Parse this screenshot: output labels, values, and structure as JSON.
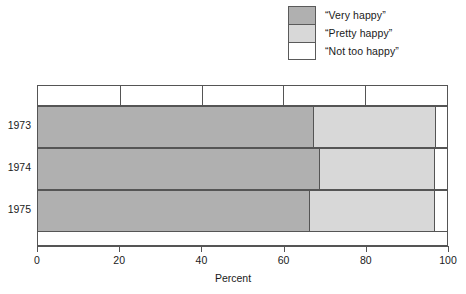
{
  "chart_data": {
    "type": "bar",
    "orientation": "horizontal",
    "stacked": true,
    "title": "",
    "xlabel": "Percent",
    "ylabel": "",
    "xlim": [
      0,
      100
    ],
    "xticks": [
      0,
      20,
      40,
      60,
      80,
      100
    ],
    "grid": false,
    "legend_position": "top-right",
    "categories": [
      "1973",
      "1974",
      "1975"
    ],
    "series": [
      {
        "name": "“Very happy”",
        "color": "#b0b0b0",
        "values": [
          67.6,
          69.0,
          66.6
        ]
      },
      {
        "name": "“Pretty happy”",
        "color": "#d8d8d8",
        "values": [
          29.7,
          28.1,
          30.4
        ]
      },
      {
        "name": "“Not too happy”",
        "color": "#ffffff",
        "values": [
          2.7,
          2.9,
          3.0
        ]
      }
    ]
  },
  "axis": {
    "xlabel": "Percent",
    "ticks": [
      "0",
      "20",
      "40",
      "60",
      "80",
      "100"
    ]
  },
  "legend": {
    "items": [
      {
        "label": "“Very happy”",
        "swatch": "very-happy-swatch"
      },
      {
        "label": "“Pretty happy”",
        "swatch": "pretty-happy-swatch"
      },
      {
        "label": "“Not too happy”",
        "swatch": "not-too-happy-swatch"
      }
    ]
  },
  "rows": [
    {
      "year": "1973"
    },
    {
      "year": "1974"
    },
    {
      "year": "1975"
    }
  ]
}
